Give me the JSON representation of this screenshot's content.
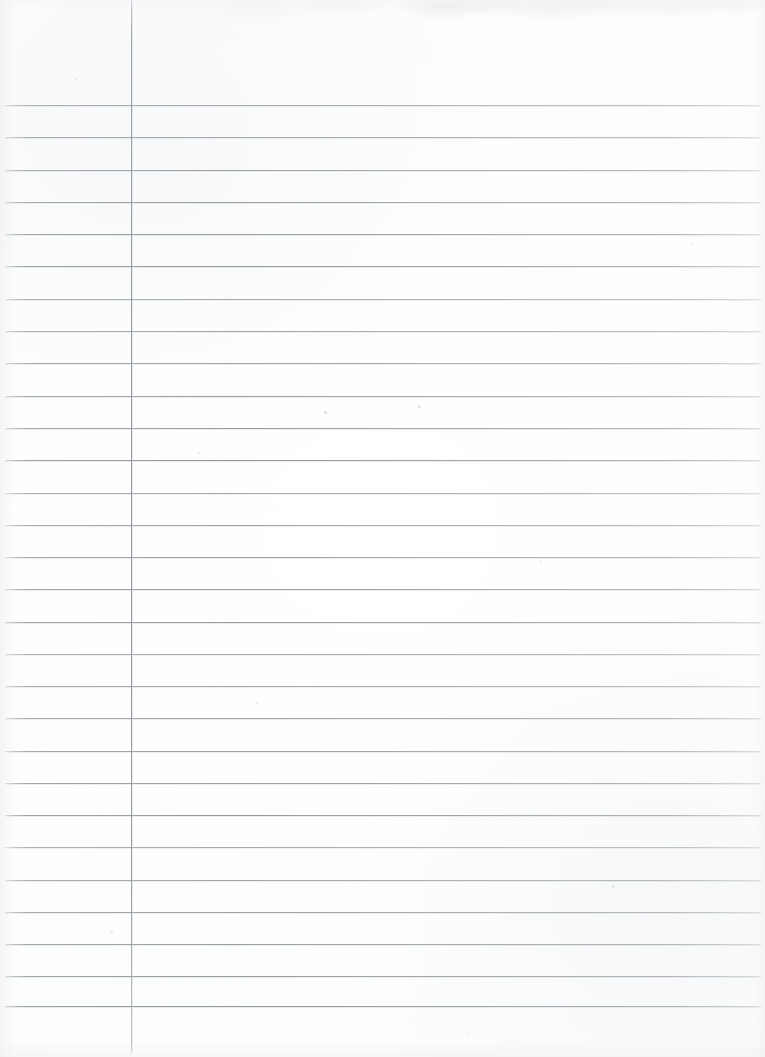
{
  "document": {
    "type": "ruled-notebook-paper",
    "title": "Blank Lined Paper",
    "content_text": "",
    "is_blank": true,
    "orientation": "portrait"
  },
  "page": {
    "width_px": 765,
    "height_px": 1057,
    "background_color": "#ffffff",
    "paper_tone_color": "#fdfdfe"
  },
  "ruling": {
    "line_color": "#9a9fa6",
    "line_count": 29,
    "line_spacing_px": 32.3,
    "first_line_y_px": 105,
    "line_thickness_px": 1,
    "line_start_x_px": 5,
    "line_end_x_px": 761,
    "top_margin_px": 105,
    "lines_y": [
      105,
      137,
      170,
      202,
      234,
      266,
      299,
      331,
      363,
      396,
      428,
      460,
      493,
      525,
      557,
      589,
      622,
      654,
      686,
      718,
      751,
      783,
      815,
      847,
      880,
      912,
      944,
      976,
      1006
    ]
  },
  "margin_rule": {
    "label": "vertical-margin-line",
    "color": "#989da4",
    "x_px": 131,
    "top_y_px": 0,
    "bottom_y_px": 1053,
    "thickness_px": 1
  },
  "regions": {
    "margin_column_label": "margin column",
    "writing_area_label": "writing area"
  },
  "specks": [
    {
      "x": 324,
      "y": 411,
      "size": 3,
      "color": "rgba(170,175,182,0.45)"
    },
    {
      "x": 418,
      "y": 405,
      "size": 3,
      "color": "rgba(176,181,188,0.40)"
    },
    {
      "x": 198,
      "y": 452,
      "size": 2,
      "color": "rgba(182,187,193,0.38)"
    },
    {
      "x": 75,
      "y": 78,
      "size": 2,
      "color": "rgba(190,194,200,0.35)"
    },
    {
      "x": 612,
      "y": 885,
      "size": 3,
      "color": "rgba(186,190,197,0.32)"
    },
    {
      "x": 256,
      "y": 702,
      "size": 2,
      "color": "rgba(188,192,198,0.34)"
    },
    {
      "x": 540,
      "y": 560,
      "size": 2,
      "color": "rgba(192,196,202,0.30)"
    },
    {
      "x": 690,
      "y": 243,
      "size": 2,
      "color": "rgba(188,192,199,0.33)"
    },
    {
      "x": 110,
      "y": 930,
      "size": 3,
      "color": "rgba(184,189,196,0.30)"
    },
    {
      "x": 466,
      "y": 1033,
      "size": 2,
      "color": "rgba(190,194,201,0.28)"
    }
  ]
}
